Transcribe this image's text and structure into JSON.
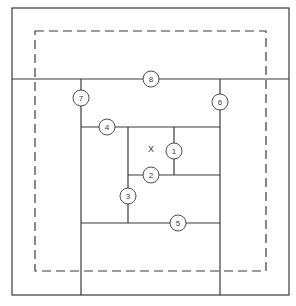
{
  "diagram": {
    "type": "floor-plan-partition",
    "colors": {
      "line": "#3a3a3a",
      "background": "#ffffff",
      "circle_fill": "#ffffff"
    },
    "outer_frame": {
      "x1": 12,
      "y1": 8,
      "x2": 289,
      "y2": 295
    },
    "dashed_frame": {
      "x1": 35,
      "y1": 31,
      "x2": 266,
      "y2": 271
    },
    "center_label": {
      "text": "X",
      "x": 151,
      "y": 150
    },
    "lines": [
      {
        "id": "8",
        "x1": 12,
        "y1": 79,
        "x2": 289,
        "y2": 79
      },
      {
        "id": "7",
        "x1": 81,
        "y1": 79,
        "x2": 81,
        "y2": 295
      },
      {
        "id": "6",
        "x1": 220,
        "y1": 79,
        "x2": 220,
        "y2": 295
      },
      {
        "id": "4",
        "x1": 81,
        "y1": 127,
        "x2": 220,
        "y2": 127
      },
      {
        "id": "3",
        "x1": 128,
        "y1": 127,
        "x2": 128,
        "y2": 223
      },
      {
        "id": "1",
        "x1": 174,
        "y1": 127,
        "x2": 174,
        "y2": 175
      },
      {
        "id": "2",
        "x1": 128,
        "y1": 175,
        "x2": 220,
        "y2": 175
      },
      {
        "id": "5",
        "x1": 81,
        "y1": 223,
        "x2": 220,
        "y2": 223
      }
    ],
    "markers": [
      {
        "label": "1",
        "x": 174,
        "y": 151
      },
      {
        "label": "2",
        "x": 151,
        "y": 175
      },
      {
        "label": "3",
        "x": 128,
        "y": 196
      },
      {
        "label": "4",
        "x": 107,
        "y": 127
      },
      {
        "label": "5",
        "x": 178,
        "y": 223
      },
      {
        "label": "6",
        "x": 220,
        "y": 102
      },
      {
        "label": "7",
        "x": 81,
        "y": 98
      },
      {
        "label": "8",
        "x": 151,
        "y": 79
      }
    ]
  }
}
